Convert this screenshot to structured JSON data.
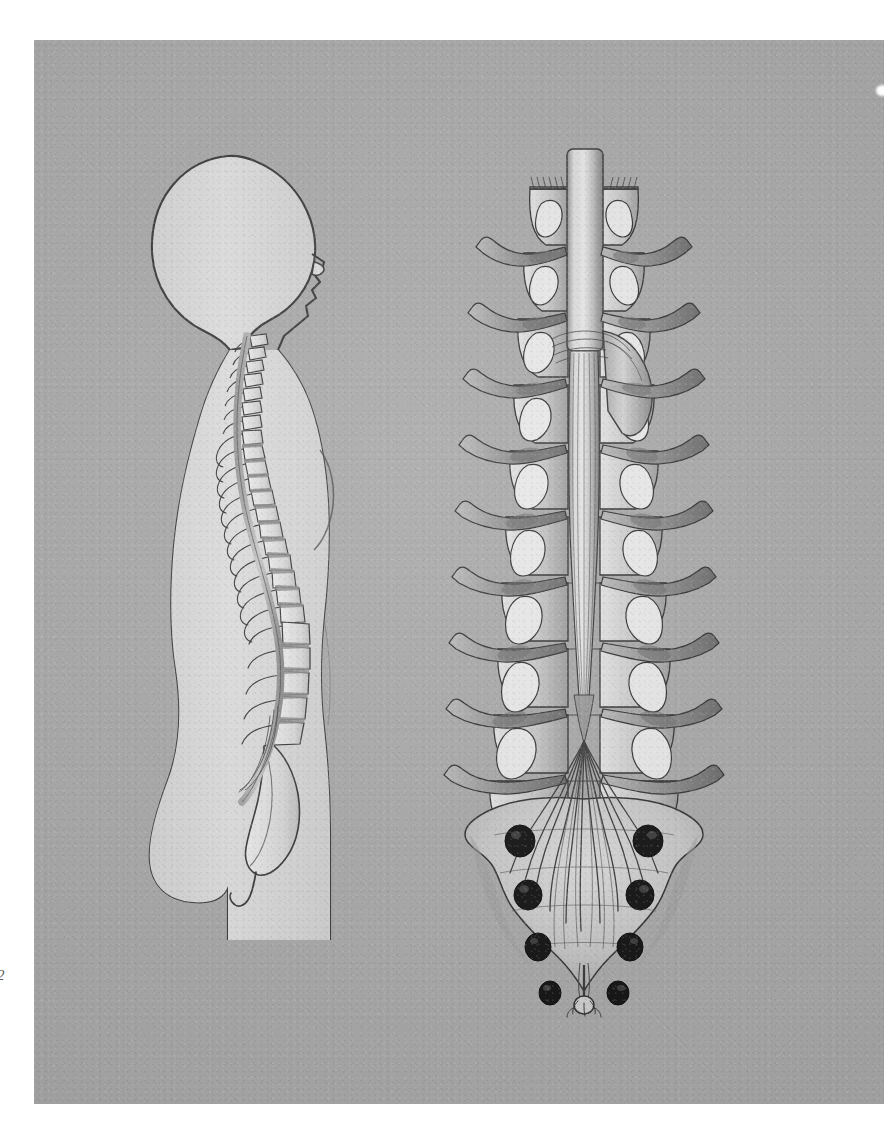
{
  "plate": {
    "kind": "anatomical-illustration",
    "medium": "halftone print on gray paper",
    "background_color": "#a9a9a9",
    "ink_color": "#2e2e2e",
    "tissue_light": "#dcdcdc",
    "tissue_mid": "#b0b0b0",
    "tissue_dark": "#6f6f6f",
    "foramen_color": "#141414",
    "folio": "2"
  },
  "figures": [
    {
      "id": "sagittal",
      "name": "lateral-body-silhouette-with-vertebral-column",
      "description": "Left-facing human head, neck and trunk silhouette in profile with the vertebral column and spinal cord shown in median sagittal section",
      "view": "lateral / sagittal",
      "parts": [
        "cranium",
        "face-profile",
        "cervical-curve",
        "thoracic-curve",
        "lumbar-curve",
        "sacrum",
        "coccyx",
        "spinal-cord",
        "spinous-processes",
        "intervertebral-discs"
      ],
      "vertebra_counts": {
        "cervical": 7,
        "thoracic": 12,
        "lumbar": 5
      }
    },
    {
      "id": "posterior",
      "name": "spinal-cord-and-cauda-equina-posterior-view",
      "description": "Posterior dissection of the spinal cord in the opened vertebral canal: cord, dura opened to one side, paired segmental nerve roots, conus medullaris, cauda equina, sacrum with dorsal sacral foramina and filum terminale",
      "view": "posterior / dorsal",
      "parts": [
        "spinal-cord",
        "dura-mater-reflected",
        "denticulate-ligament",
        "dorsal-root-ganglia",
        "segmental-spinal-nerves",
        "vertebral-laminae",
        "conus-medullaris",
        "cauda-equina",
        "sacrum",
        "dorsal-sacral-foramina",
        "filum-terminale"
      ],
      "nerve_root_pairs_visible": 11,
      "sacral_foramina_pairs": 4
    }
  ]
}
